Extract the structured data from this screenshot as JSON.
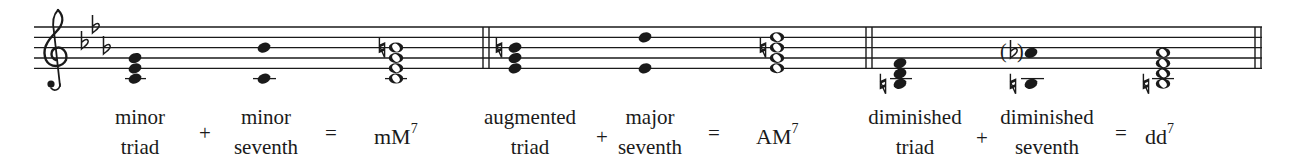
{
  "figure": {
    "clef": "treble",
    "key_signature": [
      "Bb",
      "Eb",
      "Ab"
    ],
    "staff": {
      "x_start": 34,
      "x_end": 1262,
      "lines_y": [
        27,
        37.3,
        47.6,
        58,
        68.3
      ],
      "color": "#1a1a1a"
    },
    "groups": [
      {
        "name": "minor-major-seventh",
        "left": {
          "line1": "minor",
          "line2": "triad",
          "chord_notes": [
            "C4",
            "Eb4",
            "G4"
          ]
        },
        "plus": "+",
        "right": {
          "line1": "minor",
          "line2": "seventh",
          "interval_notes": [
            "C4",
            "Bb4"
          ]
        },
        "equals": "=",
        "result": {
          "base": "mM",
          "sup": "7",
          "chord_notes": [
            "C4",
            "Eb4",
            "G4",
            "B4"
          ],
          "accidental": "natural on B4"
        }
      },
      {
        "name": "augmented-major-seventh",
        "left": {
          "line1": "augmented",
          "line2": "triad",
          "chord_notes": [
            "Eb4",
            "G4",
            "B4"
          ],
          "accidental": "natural on B4"
        },
        "plus": "+",
        "right": {
          "line1": "major",
          "line2": "seventh",
          "interval_notes": [
            "Eb4",
            "D5"
          ]
        },
        "equals": "=",
        "result": {
          "base": "AM",
          "sup": "7",
          "chord_notes": [
            "Eb4",
            "G4",
            "B4",
            "D5"
          ],
          "accidental": "natural on B4"
        }
      },
      {
        "name": "diminished-diminished-seventh",
        "left": {
          "line1": "diminished",
          "line2": "triad",
          "chord_notes": [
            "B3",
            "D4",
            "F4"
          ],
          "accidental": "natural on B3"
        },
        "plus": "+",
        "right": {
          "line1": "diminished",
          "line2": "seventh",
          "interval_notes": [
            "B3",
            "Ab4"
          ],
          "accidental": "natural on B3, courtesy (flat) on Ab4"
        },
        "equals": "=",
        "result": {
          "base": "dd",
          "sup": "7",
          "chord_notes": [
            "B3",
            "D4",
            "F4",
            "Ab4"
          ],
          "accidental": "natural on B3"
        }
      }
    ]
  }
}
